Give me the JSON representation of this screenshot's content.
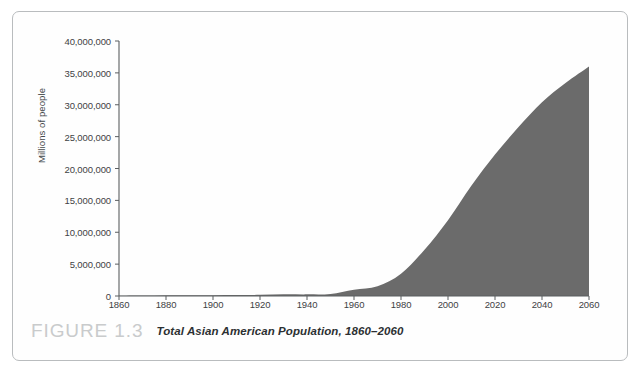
{
  "figure": {
    "number_label": "FIGURE 1.3",
    "caption": "Total Asian American Population, 1860–2060"
  },
  "colors": {
    "area_fill": "#6b6b6b",
    "axis": "#5a5e60",
    "frame_border": "#b9bcbe",
    "figure_number": "#c9cbcc",
    "tick_text": "#3e4244",
    "background": "#ffffff"
  },
  "chart_data": {
    "type": "area",
    "title": "Total Asian American Population, 1860–2060",
    "xlabel": "",
    "ylabel": "Millions of people",
    "xlim": [
      1860,
      2060
    ],
    "ylim": [
      0,
      40000000
    ],
    "grid": false,
    "legend": null,
    "xticks": [
      1860,
      1880,
      1900,
      1920,
      1940,
      1960,
      1980,
      2000,
      2020,
      2040,
      2060
    ],
    "xtick_labels": [
      "1860",
      "1880",
      "1900",
      "1920",
      "1940",
      "1960",
      "1980",
      "2000",
      "2020",
      "2040",
      "2060"
    ],
    "yticks": [
      0,
      5000000,
      10000000,
      15000000,
      20000000,
      25000000,
      30000000,
      35000000,
      40000000
    ],
    "ytick_labels": [
      "0",
      "5,000,000",
      "10,000,000",
      "15,000,000",
      "20,000,000",
      "25,000,000",
      "30,000,000",
      "35,000,000",
      "40,000,000"
    ],
    "x": [
      1860,
      1870,
      1880,
      1890,
      1900,
      1910,
      1920,
      1930,
      1940,
      1950,
      1960,
      1970,
      1980,
      1990,
      2000,
      2010,
      2020,
      2030,
      2040,
      2050,
      2060
    ],
    "values": [
      35000,
      63000,
      105000,
      110000,
      114000,
      146000,
      182000,
      264000,
      255000,
      321000,
      980000,
      1540000,
      3500000,
      7270000,
      11900000,
      17320000,
      22200000,
      26500000,
      30400000,
      33400000,
      36000000
    ],
    "series": [
      {
        "name": "Total Asian American Population",
        "values": [
          35000,
          63000,
          105000,
          110000,
          114000,
          146000,
          182000,
          264000,
          255000,
          321000,
          980000,
          1540000,
          3500000,
          7270000,
          11900000,
          17320000,
          22200000,
          26500000,
          30400000,
          33400000,
          36000000
        ]
      }
    ],
    "annotations": []
  }
}
